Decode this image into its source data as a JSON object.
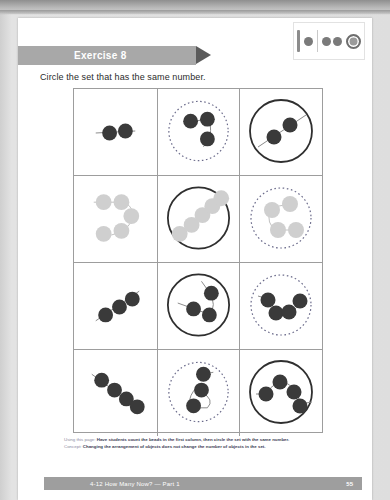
{
  "page": {
    "exercise_label": "Exercise 8",
    "instruction": "Circle the set that has the same number."
  },
  "bead_key": {
    "bar_icon": "bead-bar-icon",
    "single_dot_icon": "single-bead-icon",
    "triple_dot_icon": "triple-bead-icon",
    "ring_icon": "circled-bead-icon"
  },
  "colors": {
    "dark_bead": "#3a3a3a",
    "light_bead": "#cfcfcf",
    "banner": "#a8a8a8",
    "arrow": "#5b5b5b",
    "grid_line": "#9d9d9d",
    "bottom_bar": "#9e9e9e",
    "footer_text": "#6d6d8a"
  },
  "grid": {
    "rows": [
      {
        "row_label": "row-1",
        "bead_color": "dark",
        "cells": [
          {
            "cell_label": "row-1-reference",
            "bead_count": 2,
            "circle": "none",
            "layout": "horizontal"
          },
          {
            "cell_label": "row-1-option-a",
            "bead_count": 3,
            "circle": "dashed",
            "layout": "elbow"
          },
          {
            "cell_label": "row-1-option-b",
            "bead_count": 2,
            "circle": "solid",
            "layout": "diagonal"
          }
        ]
      },
      {
        "row_label": "row-2",
        "bead_color": "light",
        "cells": [
          {
            "cell_label": "row-2-reference",
            "bead_count": 5,
            "circle": "none",
            "layout": "scurve"
          },
          {
            "cell_label": "row-2-option-a",
            "bead_count": 5,
            "circle": "solid",
            "layout": "diagonal-chain"
          },
          {
            "cell_label": "row-2-option-b",
            "bead_count": 4,
            "circle": "dashed",
            "layout": "zigzag"
          }
        ]
      },
      {
        "row_label": "row-3",
        "bead_color": "dark",
        "cells": [
          {
            "cell_label": "row-3-reference",
            "bead_count": 3,
            "circle": "none",
            "layout": "diagonal-chain"
          },
          {
            "cell_label": "row-3-option-a",
            "bead_count": 3,
            "circle": "solid",
            "layout": "cluster"
          },
          {
            "cell_label": "row-3-option-b",
            "bead_count": 4,
            "circle": "dashed",
            "layout": "arc"
          }
        ]
      },
      {
        "row_label": "row-4",
        "bead_color": "dark",
        "cells": [
          {
            "cell_label": "row-4-reference",
            "bead_count": 4,
            "circle": "none",
            "layout": "diagonal-chain"
          },
          {
            "cell_label": "row-4-option-a",
            "bead_count": 3,
            "circle": "dashed",
            "layout": "vertical-curve"
          },
          {
            "cell_label": "row-4-option-b",
            "bead_count": 4,
            "circle": "solid",
            "layout": "arc"
          }
        ]
      }
    ]
  },
  "footer": {
    "line1_lead": "Using this page:",
    "line1_body": "Have students count the beads in the first column, then circle the set with the same number.",
    "line2_lead": "Concept:",
    "line2_body": "Changing the arrangement of objects does not change the number of objects in the set."
  },
  "bottom_bar": {
    "title": "4-12  How Many Now? — Part 1",
    "page_number": "55"
  }
}
